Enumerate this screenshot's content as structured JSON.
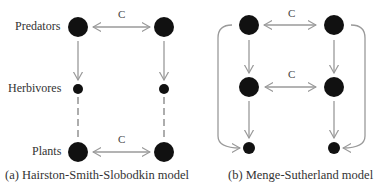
{
  "panel_a": {
    "labels": {
      "predators": "Predators",
      "herbivores": "Herbivores",
      "plants": "Plants"
    },
    "competition_label_top": "C",
    "competition_label_bottom": "C",
    "caption": "(a) Hairston-Smith-Slobodkin model"
  },
  "panel_b": {
    "competition_label_top": "C",
    "competition_label_middle": "C",
    "caption": "(b) Menge-Sutherland model"
  },
  "colors": {
    "node": "#111111",
    "arrow": "#9a9a9a"
  }
}
